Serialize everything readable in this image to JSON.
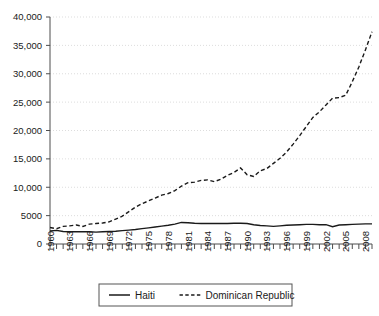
{
  "chart_data": {
    "type": "line",
    "title": "",
    "subtitle": "",
    "xlabel": "",
    "ylabel": "",
    "grid": "horizontal-dotted",
    "legend_position": "bottom-center",
    "xlim": [
      1960,
      2009
    ],
    "ylim": [
      0,
      40000
    ],
    "ytick_labels": [
      "40,000",
      "35,000",
      "30,000",
      "25,000",
      "20,000",
      "15,000",
      "10,000",
      "5000",
      "0"
    ],
    "ytick_values": [
      40000,
      35000,
      30000,
      25000,
      20000,
      15000,
      10000,
      5000,
      0
    ],
    "xtick_labels": [
      "1960",
      "1963",
      "1966",
      "1969",
      "1972",
      "1975",
      "1978",
      "1981",
      "1984",
      "1987",
      "1990",
      "1993",
      "1996",
      "1999",
      "2002",
      "2005",
      "2008"
    ],
    "xtick_values": [
      1960,
      1963,
      1966,
      1969,
      1972,
      1975,
      1978,
      1981,
      1984,
      1987,
      1990,
      1993,
      1996,
      1999,
      2002,
      2005,
      2008
    ],
    "minor_xticks_every": 1,
    "x": [
      1960,
      1961,
      1962,
      1963,
      1964,
      1965,
      1966,
      1967,
      1968,
      1969,
      1970,
      1971,
      1972,
      1973,
      1974,
      1975,
      1976,
      1977,
      1978,
      1979,
      1980,
      1981,
      1982,
      1983,
      1984,
      1985,
      1986,
      1987,
      1988,
      1989,
      1990,
      1991,
      1992,
      1993,
      1994,
      1995,
      1996,
      1997,
      1998,
      1999,
      2000,
      2001,
      2002,
      2003,
      2004,
      2005,
      2006,
      2007,
      2008,
      2009
    ],
    "series": [
      {
        "name": "Haiti",
        "style": "solid",
        "color": "#1a1a1a",
        "values": [
          2300,
          2400,
          2200,
          2150,
          2150,
          2150,
          2150,
          2100,
          2150,
          2200,
          2250,
          2350,
          2450,
          2550,
          2700,
          2850,
          3000,
          3150,
          3300,
          3500,
          3800,
          3750,
          3650,
          3600,
          3600,
          3600,
          3600,
          3600,
          3650,
          3650,
          3600,
          3400,
          3250,
          3200,
          3100,
          3200,
          3300,
          3350,
          3400,
          3450,
          3450,
          3400,
          3400,
          3050,
          3350,
          3400,
          3450,
          3500,
          3550,
          3550
        ]
      },
      {
        "name": "Dominican Republic",
        "style": "dashed",
        "color": "#1a1a1a",
        "values": [
          2900,
          2700,
          3100,
          3200,
          3350,
          3100,
          3500,
          3600,
          3700,
          3900,
          4400,
          4900,
          5700,
          6500,
          7100,
          7600,
          8100,
          8600,
          8900,
          9400,
          10200,
          10800,
          10900,
          11200,
          11300,
          11000,
          11400,
          12100,
          12600,
          13400,
          12200,
          11900,
          12900,
          13300,
          14200,
          15100,
          16200,
          17600,
          19100,
          20700,
          22300,
          23300,
          24500,
          25700,
          25800,
          26200,
          28600,
          31200,
          34200,
          37400
        ]
      }
    ],
    "legend": [
      {
        "label": "Haiti",
        "style": "solid"
      },
      {
        "label": "Dominican Republic",
        "style": "dashed"
      }
    ]
  }
}
